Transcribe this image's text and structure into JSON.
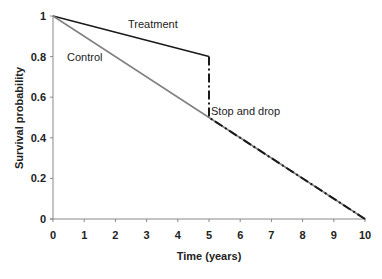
{
  "chart_data": {
    "type": "line",
    "title": "",
    "xlabel": "Time (years)",
    "ylabel": "Survival probability",
    "xlim": [
      0,
      10
    ],
    "ylim": [
      0,
      1
    ],
    "x_ticks": [
      "0",
      "1",
      "2",
      "3",
      "4",
      "5",
      "6",
      "7",
      "8",
      "9",
      "10"
    ],
    "y_ticks": [
      "0",
      "0.2",
      "0.4",
      "0.6",
      "0.8",
      "1"
    ],
    "grid": false,
    "legend": null,
    "series": [
      {
        "name": "Treatment",
        "style": "solid",
        "color": "#1a1a1a",
        "x": [
          0,
          5
        ],
        "y": [
          1,
          0.8
        ]
      },
      {
        "name": "Control",
        "style": "solid",
        "color": "#808080",
        "x": [
          0,
          10
        ],
        "y": [
          1,
          0
        ]
      },
      {
        "name": "Stop and drop",
        "style": "dash-dot",
        "color": "#1a1a1a",
        "x": [
          5,
          5,
          10
        ],
        "y": [
          0.8,
          0.5,
          0
        ]
      }
    ],
    "annotations": [
      {
        "text": "Treatment",
        "x": 2.4,
        "y": 0.95
      },
      {
        "text": "Control",
        "x": 0.6,
        "y": 0.81
      },
      {
        "text": "Stop and drop",
        "x": 5.1,
        "y": 0.53
      }
    ]
  }
}
